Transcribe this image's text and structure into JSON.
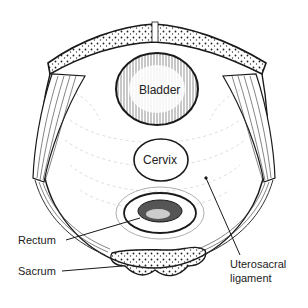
{
  "diagram": {
    "type": "anatomical-cross-section",
    "colors": {
      "ink": "#1a1a1a",
      "background": "#ffffff"
    },
    "structures": [
      {
        "id": "bladder",
        "label": "Bladder"
      },
      {
        "id": "cervix",
        "label": "Cervix"
      },
      {
        "id": "rectum",
        "label": "Rectum"
      },
      {
        "id": "sacrum",
        "label": "Sacrum"
      },
      {
        "id": "uterosacral",
        "label_line1": "Uterosacral",
        "label_line2": "ligament"
      }
    ]
  }
}
